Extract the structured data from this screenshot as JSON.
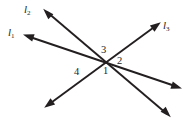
{
  "figure": {
    "background_color": "#ffffff",
    "ink_color": "#231f20",
    "width": 191,
    "height": 124
  },
  "line_labels": [
    {
      "id": "l2",
      "base": "l",
      "subscript": "2",
      "text": "l2",
      "x": 24,
      "y": 4
    },
    {
      "id": "l1",
      "base": "l",
      "subscript": "1",
      "text": "l1",
      "x": 8,
      "y": 27
    },
    {
      "id": "l3",
      "base": "l",
      "subscript": "3",
      "text": "l3",
      "x": 162,
      "y": 20
    }
  ],
  "angle_numbers": [
    {
      "id": "angle-3",
      "label": "3",
      "x": 101,
      "y": 45
    },
    {
      "id": "angle-2",
      "label": "2",
      "x": 117,
      "y": 56
    },
    {
      "id": "angle-1",
      "label": "1",
      "x": 103,
      "y": 66
    },
    {
      "id": "angle-4",
      "label": "4",
      "x": 74,
      "y": 67
    }
  ],
  "lines": [
    {
      "id": "l1",
      "name": "line-l1",
      "x1": 27,
      "y1": 36,
      "x2": 178,
      "y2": 87,
      "arrow_start": true,
      "arrow_end": true
    },
    {
      "id": "l2",
      "name": "line-l2",
      "x1": 47,
      "y1": 12,
      "x2": 167,
      "y2": 114,
      "arrow_start": true,
      "arrow_end": true
    },
    {
      "id": "l3",
      "name": "line-l3",
      "x1": 48,
      "y1": 105,
      "x2": 157,
      "y2": 25,
      "arrow_start": true,
      "arrow_end": true
    }
  ]
}
